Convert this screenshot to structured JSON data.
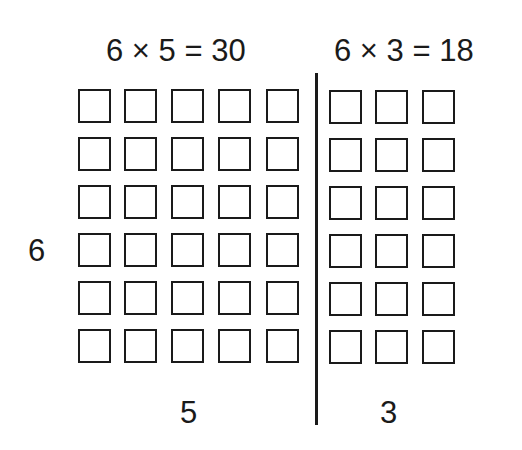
{
  "diagram": {
    "left_equation": "6 × 5 = 30",
    "right_equation": "6 × 3 = 18",
    "row_label": "6",
    "left_col_label": "5",
    "right_col_label": "3",
    "rows": 6,
    "left_cols": 5,
    "right_cols": 3,
    "stroke_color": "#1a1a1a",
    "background": "#ffffff"
  }
}
